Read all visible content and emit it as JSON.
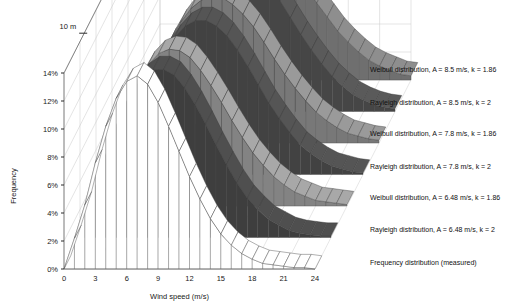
{
  "chart_data": {
    "type": "line",
    "render": "3d-ribbon",
    "title": "",
    "xlabel": "Wind speed (m/s)",
    "ylabel": "Frequency",
    "zlabel": "",
    "xlim": [
      0,
      24
    ],
    "ylim": [
      0,
      0.15
    ],
    "xticks": [
      0,
      3,
      6,
      9,
      12,
      15,
      18,
      21,
      24
    ],
    "xticklabels": [
      "0",
      "3",
      "6",
      "9",
      "12",
      "15",
      "18",
      "21",
      "24"
    ],
    "yticks": [
      0,
      2,
      4,
      6,
      8,
      10,
      12,
      14
    ],
    "yticklabels": [
      "0%",
      "2%",
      "4%",
      "6%",
      "8%",
      "10%",
      "12%",
      "14%"
    ],
    "zticklabels": [
      "10 m",
      "30 m",
      "50 m"
    ],
    "grid": true,
    "legend_position": "right-inline",
    "x": [
      0,
      1,
      2,
      3,
      4,
      5,
      6,
      7,
      8,
      9,
      10,
      11,
      12,
      13,
      14,
      15,
      16,
      17,
      18,
      19,
      20,
      21,
      22,
      23,
      24
    ],
    "series": [
      {
        "name": "Weibull distribution, A = 8.5 m/s, k = 1.86",
        "A": 8.5,
        "k": 1.86,
        "color": "#8e8e8e",
        "depth_index": 6,
        "values": [
          0.0,
          1.7,
          3.4,
          5.0,
          6.5,
          7.8,
          8.8,
          9.6,
          10.0,
          10.1,
          9.9,
          9.4,
          8.6,
          7.7,
          6.6,
          5.5,
          4.5,
          3.5,
          2.7,
          2.0,
          1.4,
          1.0,
          0.7,
          0.4,
          0.3
        ]
      },
      {
        "name": "Rayleigh distribution, A = 8.5 m/s, k = 2",
        "A": 8.5,
        "k": 2,
        "color": "#5a5a5a",
        "depth_index": 5,
        "values": [
          0.0,
          1.6,
          3.2,
          4.8,
          6.3,
          7.6,
          8.8,
          9.6,
          10.2,
          10.4,
          10.2,
          9.7,
          8.9,
          7.9,
          6.7,
          5.5,
          4.4,
          3.4,
          2.5,
          1.8,
          1.2,
          0.8,
          0.5,
          0.3,
          0.2
        ]
      },
      {
        "name": "Weibull distribution, A = 7.8 m/s, k = 1.86",
        "A": 7.8,
        "k": 1.86,
        "color": "#9a9a9a",
        "depth_index": 4,
        "values": [
          0.0,
          2.0,
          3.9,
          5.7,
          7.3,
          8.6,
          9.6,
          10.2,
          10.5,
          10.4,
          9.9,
          9.2,
          8.3,
          7.2,
          6.0,
          4.9,
          3.9,
          3.0,
          2.2,
          1.6,
          1.1,
          0.7,
          0.5,
          0.3,
          0.2
        ]
      },
      {
        "name": "Rayleigh distribution, A = 7.8 m/s, k = 2",
        "A": 7.8,
        "k": 2,
        "color": "#555555",
        "depth_index": 3,
        "values": [
          0.0,
          1.9,
          3.8,
          5.6,
          7.2,
          8.7,
          9.8,
          10.6,
          11.0,
          11.0,
          10.6,
          9.9,
          8.9,
          7.7,
          6.4,
          5.1,
          4.0,
          3.0,
          2.1,
          1.5,
          1.0,
          0.6,
          0.4,
          0.2,
          0.1
        ]
      },
      {
        "name": "Weibull distribution, A = 6.48 m/s, k = 1.86",
        "A": 6.48,
        "k": 1.86,
        "color": "#a8a8a8",
        "depth_index": 2,
        "values": [
          0.0,
          2.6,
          5.0,
          7.1,
          8.8,
          10.1,
          10.9,
          11.2,
          11.1,
          10.6,
          9.7,
          8.6,
          7.4,
          6.1,
          4.9,
          3.8,
          2.9,
          2.1,
          1.5,
          1.0,
          0.7,
          0.4,
          0.3,
          0.2,
          0.1
        ]
      },
      {
        "name": "Rayleigh distribution, A = 6.48 m/s, k = 2",
        "A": 6.48,
        "k": 2,
        "color": "#4f4f4f",
        "depth_index": 1,
        "values": [
          0.0,
          2.5,
          4.9,
          7.1,
          9.0,
          10.5,
          11.5,
          12.0,
          12.0,
          11.6,
          10.7,
          9.5,
          8.1,
          6.6,
          5.2,
          3.9,
          2.8,
          2.0,
          1.3,
          0.9,
          0.5,
          0.3,
          0.2,
          0.1,
          0.1
        ]
      },
      {
        "name": "Frequency distribution (measured)",
        "color": "#ffffff",
        "depth_index": 0,
        "values": [
          0.0,
          2.2,
          4.6,
          7.6,
          10.2,
          12.2,
          13.4,
          13.8,
          13.2,
          11.9,
          10.2,
          8.4,
          6.6,
          5.0,
          3.6,
          2.5,
          1.7,
          1.1,
          0.7,
          0.4,
          0.3,
          0.2,
          0.1,
          0.1,
          0.0
        ]
      }
    ]
  },
  "axes": {
    "x_title": "Wind speed (m/s)",
    "y_title": "Frequency",
    "x_ticks": [
      "0",
      "3",
      "6",
      "9",
      "12",
      "15",
      "18",
      "21",
      "24"
    ],
    "y_ticks": [
      "0%",
      "2%",
      "4%",
      "6%",
      "8%",
      "10%",
      "12%",
      "14%"
    ],
    "depth_ticks": [
      "10 m",
      "30 m",
      "50 m"
    ]
  },
  "legend": {
    "items": [
      {
        "label": "Weibull distribution, A = 8.5 m/s, k = 1.86"
      },
      {
        "label": "Rayleigh distribution, A = 8.5 m/s, k = 2"
      },
      {
        "label": "Weibull distribution, A = 7.8 m/s, k = 1.86"
      },
      {
        "label": "Rayleigh distribution, A = 7.8 m/s, k = 2"
      },
      {
        "label": "Weibull distribution, A = 6.48 m/s, k = 1.86"
      },
      {
        "label": "Rayleigh distribution, A = 6.48 m/s, k = 2"
      },
      {
        "label": "Frequency distribution (measured)"
      }
    ]
  }
}
